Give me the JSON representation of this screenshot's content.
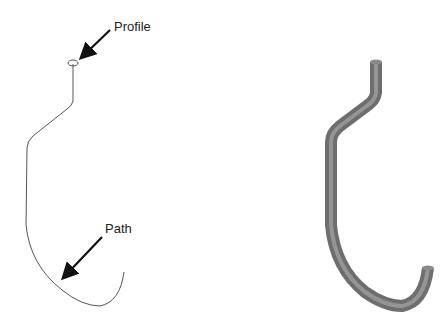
{
  "diagram": {
    "labels": {
      "profile": "Profile",
      "path": "Path"
    },
    "left_view": "sketch-profile-and-path",
    "right_view": "swept-tube-result",
    "colors": {
      "line": "#555555",
      "arrow": "#111111",
      "tube_dark": "#6a6a6a",
      "tube_mid": "#9a9a9a",
      "tube_light": "#cfcfcf"
    }
  }
}
